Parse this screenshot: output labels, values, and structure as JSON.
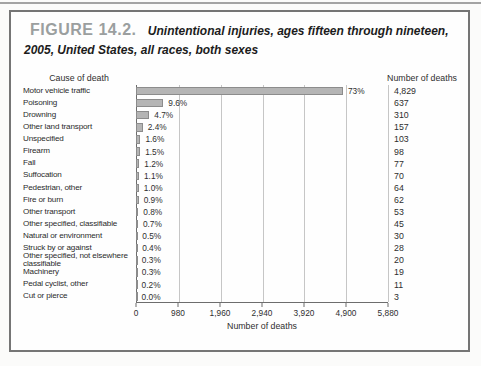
{
  "figure": {
    "number": "FIGURE 14.2.",
    "caption": "Unintentional injuries, ages fifteen through nineteen, 2005, United States, all races, both sexes"
  },
  "chart_data": {
    "type": "bar",
    "orientation": "horizontal",
    "col_header_left": "Cause of death",
    "col_header_right": "Number of deaths",
    "xlabel": "Number of deaths",
    "xlim": [
      0,
      5880
    ],
    "xticks": [
      "0",
      "980",
      "1,960",
      "2,940",
      "3,920",
      "4,900",
      "5,880"
    ],
    "grid": "vertical-at-ticks",
    "bar_color": "#b5b5b5",
    "bar_border_color": "#8c8c8c",
    "rows": [
      {
        "cause": "Motor vehicle traffic",
        "pct": "73%",
        "deaths": 4829,
        "deaths_label": "4,829"
      },
      {
        "cause": "Poisoning",
        "pct": "9.6%",
        "deaths": 637,
        "deaths_label": "637"
      },
      {
        "cause": "Drowning",
        "pct": "4.7%",
        "deaths": 310,
        "deaths_label": "310"
      },
      {
        "cause": "Other land transport",
        "pct": "2.4%",
        "deaths": 157,
        "deaths_label": "157"
      },
      {
        "cause": "Unspecified",
        "pct": "1.6%",
        "deaths": 103,
        "deaths_label": "103"
      },
      {
        "cause": "Firearm",
        "pct": "1.5%",
        "deaths": 98,
        "deaths_label": "98"
      },
      {
        "cause": "Fall",
        "pct": "1.2%",
        "deaths": 77,
        "deaths_label": "77"
      },
      {
        "cause": "Suffocation",
        "pct": "1.1%",
        "deaths": 70,
        "deaths_label": "70"
      },
      {
        "cause": "Pedestrian, other",
        "pct": "1.0%",
        "deaths": 64,
        "deaths_label": "64"
      },
      {
        "cause": "Fire or burn",
        "pct": "0.9%",
        "deaths": 62,
        "deaths_label": "62"
      },
      {
        "cause": "Other transport",
        "pct": "0.8%",
        "deaths": 53,
        "deaths_label": "53"
      },
      {
        "cause": "Other specified, classifiable",
        "pct": "0.7%",
        "deaths": 45,
        "deaths_label": "45"
      },
      {
        "cause": "Natural or environment",
        "pct": "0.5%",
        "deaths": 30,
        "deaths_label": "30"
      },
      {
        "cause": "Struck by or against",
        "pct": "0.4%",
        "deaths": 28,
        "deaths_label": "28"
      },
      {
        "cause": "Other specified, not elsewhere classifiable",
        "pct": "0.3%",
        "deaths": 20,
        "deaths_label": "20"
      },
      {
        "cause": "Machinery",
        "pct": "0.3%",
        "deaths": 19,
        "deaths_label": "19"
      },
      {
        "cause": "Pedal cyclist, other",
        "pct": "0.2%",
        "deaths": 11,
        "deaths_label": "11"
      },
      {
        "cause": "Cut or pierce",
        "pct": "0.0%",
        "deaths": 3,
        "deaths_label": "3"
      }
    ]
  }
}
